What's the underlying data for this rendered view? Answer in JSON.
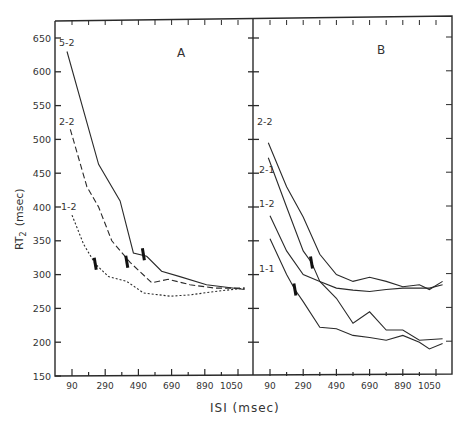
{
  "chart_data": [
    {
      "panel": "A",
      "type": "line",
      "title": "A",
      "xlabel": "ISI (msec)",
      "ylabel": "RT2 (msec)",
      "xticks": [
        90,
        290,
        490,
        690,
        890,
        1050
      ],
      "yticks": [
        150,
        200,
        250,
        300,
        350,
        400,
        450,
        500,
        550,
        600,
        650
      ],
      "xlim": [
        -10,
        1190
      ],
      "ylim": [
        150,
        670
      ],
      "grid": false,
      "series": [
        {
          "name": "5-2",
          "style": "solid",
          "x": [
            60,
            250,
            380,
            460,
            540,
            630,
            740,
            900,
            1130
          ],
          "y": [
            630,
            463,
            409,
            332,
            327,
            305,
            297,
            285,
            278
          ]
        },
        {
          "name": "2-2",
          "style": "dashed",
          "x": [
            80,
            180,
            250,
            330,
            440,
            570,
            670,
            800,
            950,
            1130
          ],
          "y": [
            515,
            430,
            400,
            350,
            318,
            288,
            293,
            285,
            280,
            280
          ]
        },
        {
          "name": "1-2",
          "style": "dotted",
          "x": [
            90,
            160,
            230,
            310,
            420,
            520,
            680,
            800,
            950,
            1130
          ],
          "y": [
            388,
            345,
            316,
            297,
            290,
            273,
            268,
            270,
            275,
            280
          ]
        }
      ],
      "markers": [
        {
          "series": "1-2",
          "x": 230,
          "y": 316
        },
        {
          "series": "2-2",
          "x": 420,
          "y": 319
        },
        {
          "series": "5-2",
          "x": 520,
          "y": 330
        }
      ]
    },
    {
      "panel": "B",
      "type": "line",
      "title": "B",
      "xlabel": "ISI (msec)",
      "ylabel": "RT2 (msec)",
      "xticks": [
        90,
        290,
        490,
        690,
        890,
        1050
      ],
      "yticks": [
        150,
        200,
        250,
        300,
        350,
        400,
        450,
        500,
        550,
        600,
        650
      ],
      "xlim": [
        -10,
        1190
      ],
      "ylim": [
        150,
        670
      ],
      "grid": false,
      "series": [
        {
          "name": "2-2",
          "style": "solid",
          "x": [
            80,
            190,
            290,
            390,
            490,
            590,
            690,
            790,
            890,
            990,
            1050,
            1130
          ],
          "y": [
            495,
            430,
            385,
            330,
            300,
            290,
            296,
            290,
            282,
            285,
            278,
            290
          ]
        },
        {
          "name": "2-1",
          "style": "solid",
          "x": [
            80,
            190,
            290,
            340,
            390,
            490,
            590,
            690,
            790,
            890,
            990,
            1130
          ],
          "y": [
            473,
            400,
            335,
            318,
            290,
            265,
            228,
            245,
            218,
            218,
            203,
            205
          ]
        },
        {
          "name": "1-2",
          "style": "solid",
          "x": [
            90,
            190,
            290,
            390,
            490,
            590,
            690,
            790,
            890,
            1050,
            1130
          ],
          "y": [
            387,
            335,
            300,
            290,
            280,
            277,
            275,
            278,
            280,
            280,
            285
          ]
        },
        {
          "name": "1-1",
          "style": "solid",
          "x": [
            90,
            190,
            240,
            290,
            390,
            490,
            590,
            690,
            790,
            890,
            990,
            1050,
            1130
          ],
          "y": [
            353,
            300,
            278,
            260,
            222,
            220,
            210,
            207,
            203,
            210,
            200,
            190,
            198
          ]
        }
      ],
      "markers": [
        {
          "series": "1-1",
          "x": 240,
          "y": 278
        },
        {
          "series": "2-1",
          "x": 340,
          "y": 318
        }
      ]
    }
  ],
  "figure": {
    "panel_a_label": "A",
    "panel_b_label": "B",
    "y_axis_label_main": "RT",
    "y_axis_label_sub": "2",
    "y_axis_label_unit": "(msec)",
    "x_axis_label": "ISI (msec)",
    "series_labels_a": [
      "5-2",
      "2-2",
      "1-2"
    ],
    "series_labels_b": [
      "2-2",
      "2-1",
      "1-2",
      "1-1"
    ],
    "line_color": "#2a2a2a",
    "text_color": "#333333"
  }
}
